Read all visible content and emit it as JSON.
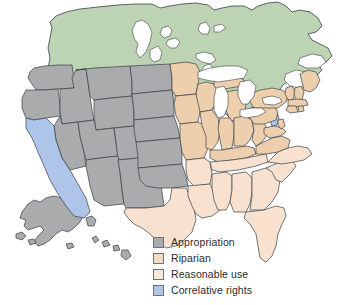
{
  "map": {
    "title": "United States water rights doctrines map",
    "background_color": "#ffffff",
    "border_color": "#3a3f45",
    "colors": {
      "appropriation": "#a9abad",
      "riparian": "#eecfad",
      "reasonable_use": "#f8e2cf",
      "correlative_rights": "#aec4e8",
      "canada": "#bdd4b4",
      "mexico_and_other": "#ffffff",
      "lakes": "#ffffff"
    },
    "regions": [
      {
        "name": "Canada",
        "category": "canada"
      },
      {
        "name": "Washington",
        "category": "appropriation"
      },
      {
        "name": "Oregon",
        "category": "appropriation"
      },
      {
        "name": "Idaho",
        "category": "appropriation"
      },
      {
        "name": "Montana",
        "category": "appropriation"
      },
      {
        "name": "Wyoming",
        "category": "appropriation"
      },
      {
        "name": "Nevada",
        "category": "appropriation"
      },
      {
        "name": "Utah",
        "category": "appropriation"
      },
      {
        "name": "Colorado",
        "category": "appropriation"
      },
      {
        "name": "Arizona",
        "category": "appropriation"
      },
      {
        "name": "New Mexico",
        "category": "appropriation"
      },
      {
        "name": "North Dakota",
        "category": "appropriation"
      },
      {
        "name": "South Dakota",
        "category": "appropriation"
      },
      {
        "name": "Nebraska",
        "category": "appropriation"
      },
      {
        "name": "Kansas",
        "category": "appropriation"
      },
      {
        "name": "Oklahoma",
        "category": "appropriation"
      },
      {
        "name": "Alaska",
        "category": "appropriation"
      },
      {
        "name": "Hawaii",
        "category": "appropriation"
      },
      {
        "name": "California",
        "category": "correlative_rights"
      },
      {
        "name": "New Jersey",
        "category": "correlative_rights"
      },
      {
        "name": "Texas",
        "category": "reasonable_use"
      },
      {
        "name": "Minnesota",
        "category": "riparian"
      },
      {
        "name": "Wisconsin",
        "category": "riparian"
      },
      {
        "name": "Michigan",
        "category": "riparian"
      },
      {
        "name": "Iowa",
        "category": "riparian"
      },
      {
        "name": "Missouri",
        "category": "riparian"
      },
      {
        "name": "Arkansas",
        "category": "reasonable_use"
      },
      {
        "name": "Louisiana",
        "category": "reasonable_use"
      },
      {
        "name": "Illinois",
        "category": "riparian"
      },
      {
        "name": "Indiana",
        "category": "riparian"
      },
      {
        "name": "Ohio",
        "category": "riparian"
      },
      {
        "name": "Kentucky",
        "category": "riparian"
      },
      {
        "name": "Tennessee",
        "category": "reasonable_use"
      },
      {
        "name": "Mississippi",
        "category": "reasonable_use"
      },
      {
        "name": "Alabama",
        "category": "reasonable_use"
      },
      {
        "name": "Georgia",
        "category": "reasonable_use"
      },
      {
        "name": "Florida",
        "category": "reasonable_use"
      },
      {
        "name": "South Carolina",
        "category": "reasonable_use"
      },
      {
        "name": "North Carolina",
        "category": "reasonable_use"
      },
      {
        "name": "Virginia",
        "category": "riparian"
      },
      {
        "name": "West Virginia",
        "category": "riparian"
      },
      {
        "name": "Maryland",
        "category": "riparian"
      },
      {
        "name": "Delaware",
        "category": "riparian"
      },
      {
        "name": "Pennsylvania",
        "category": "riparian"
      },
      {
        "name": "New York",
        "category": "riparian"
      },
      {
        "name": "Vermont",
        "category": "riparian"
      },
      {
        "name": "New Hampshire",
        "category": "riparian"
      },
      {
        "name": "Maine",
        "category": "riparian"
      },
      {
        "name": "Massachusetts",
        "category": "riparian"
      },
      {
        "name": "Connecticut",
        "category": "riparian"
      },
      {
        "name": "Rhode Island",
        "category": "riparian"
      }
    ]
  },
  "legend": {
    "items": [
      {
        "label": "Appropriation",
        "color": "#a9abad"
      },
      {
        "label": "Riparian",
        "color": "#f3dcc0"
      },
      {
        "label": "Reasonable use",
        "color": "#f9e6d6"
      },
      {
        "label": "Correlative rights",
        "color": "#aec4e8"
      }
    ]
  }
}
